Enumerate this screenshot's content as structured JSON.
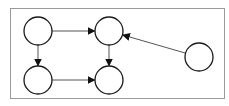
{
  "diagram": {
    "type": "directed-graph",
    "canvas": {
      "width": 229,
      "height": 106,
      "background": "#ffffff"
    },
    "frame": {
      "x": 10,
      "y": 8,
      "width": 214,
      "height": 90,
      "stroke": "#9a9a9a"
    },
    "style": {
      "node_stroke": "#1a1a1a",
      "node_fill": "#ffffff",
      "edge_stroke": "#555555",
      "arrowhead_fill": "#111111",
      "node_radius": 14
    },
    "nodes": [
      {
        "id": "A",
        "label": "",
        "cx": 38,
        "cy": 31
      },
      {
        "id": "B",
        "label": "",
        "cx": 109,
        "cy": 31
      },
      {
        "id": "C",
        "label": "",
        "cx": 38,
        "cy": 80
      },
      {
        "id": "D",
        "label": "",
        "cx": 109,
        "cy": 80
      },
      {
        "id": "E",
        "label": "",
        "cx": 199,
        "cy": 57
      }
    ],
    "edges": [
      {
        "from": "A",
        "to": "B"
      },
      {
        "from": "A",
        "to": "C"
      },
      {
        "from": "B",
        "to": "D"
      },
      {
        "from": "C",
        "to": "D"
      },
      {
        "from": "E",
        "to": "B"
      }
    ]
  }
}
